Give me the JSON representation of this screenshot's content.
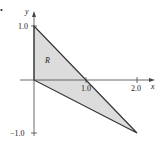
{
  "diagram": {
    "axes": {
      "x_label": "x",
      "y_label": "y",
      "x_ticks": [
        "1.0",
        "2.0"
      ],
      "y_ticks": [
        "1.0",
        "−1.0"
      ]
    },
    "region": {
      "label": "R",
      "vertices": [
        [
          0,
          1
        ],
        [
          0,
          0
        ],
        [
          2,
          -1
        ]
      ],
      "fill": "#dcdcdc",
      "stroke": "#333333"
    },
    "bullet": "•"
  }
}
